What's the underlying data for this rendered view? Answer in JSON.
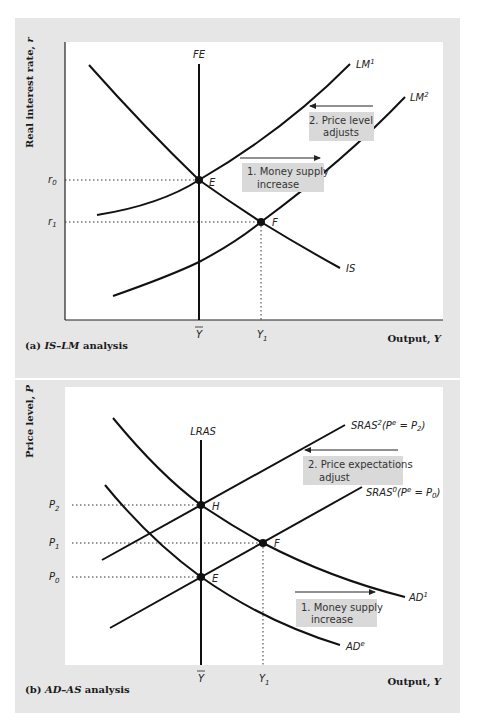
{
  "panel_a": {
    "caption_prefix": "(a) ",
    "caption_italic": "IS–LM",
    "caption_suffix": " analysis",
    "y_axis_label": "Real interest rate, ",
    "y_axis_var": "r",
    "x_axis_label": "Output, ",
    "x_axis_var": "Y",
    "curves": {
      "fe": "FE",
      "is": "IS",
      "lm1_base": "LM",
      "lm1_sup": "1",
      "lm2_base": "LM",
      "lm2_sup": "2"
    },
    "points": {
      "e": "E",
      "f": "F"
    },
    "y_ticks": {
      "r0_base": "r",
      "r0_sub": "0",
      "r1_base": "r",
      "r1_sub": "1"
    },
    "x_ticks": {
      "ybar": "Y",
      "y1_base": "Y",
      "y1_sub": "1"
    },
    "annotations": {
      "step1_line1": "1. Money supply",
      "step1_line2": "increase",
      "step2_line1": "2. Price level",
      "step2_line2": "adjusts"
    }
  },
  "panel_b": {
    "caption_prefix": "(b) ",
    "caption_italic": "AD–AS",
    "caption_suffix": " analysis",
    "y_axis_label": "Price level, ",
    "y_axis_var": "P",
    "x_axis_label": "Output, ",
    "x_axis_var": "Y",
    "curves": {
      "lras": "LRAS",
      "sras2_base": "SRAS",
      "sras2_sup": "2",
      "sras2_paren": "(P",
      "sras2_pe_sup": "e",
      "sras2_eq": " = P",
      "sras2_sub": "2",
      "sras2_close": ")",
      "sras0_base": "SRAS",
      "sras0_sup": "0",
      "sras0_paren": "(P",
      "sras0_pe_sup": "e",
      "sras0_eq": " = P",
      "sras0_sub": "0",
      "sras0_close": ")",
      "ad1_base": "AD",
      "ad1_sup": "1",
      "ade_base": "AD",
      "ade_sup": "e"
    },
    "points": {
      "h": "H",
      "f": "F",
      "e": "E"
    },
    "y_ticks": {
      "p2_base": "P",
      "p2_sub": "2",
      "p1_base": "P",
      "p1_sub": "1",
      "p0_base": "P",
      "p0_sub": "0"
    },
    "x_ticks": {
      "ybar": "Y",
      "y1_base": "Y",
      "y1_sub": "1"
    },
    "annotations": {
      "step1_line1": "1. Money supply",
      "step1_line2": "increase",
      "step2_line1": "2. Price expectations",
      "step2_line2": "adjust"
    }
  },
  "colors": {
    "panel_bg": "#e6e6e6",
    "plot_bg": "#ffffff",
    "curve": "#111111",
    "annotation_box": "#d9d9d9"
  }
}
